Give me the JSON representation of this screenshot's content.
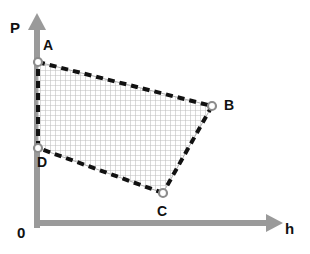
{
  "figure": {
    "width": 310,
    "height": 254,
    "background": "#ffffff"
  },
  "axes": {
    "y_axis": {
      "label": "P",
      "name": "pressure-axis",
      "color": "#9a9a9a",
      "x": 37,
      "y_top": 14,
      "y_bottom": 228,
      "stroke_width": 6,
      "arrow": "up"
    },
    "x_axis": {
      "label": "h",
      "name": "enthalpy-axis",
      "color": "#9a9a9a",
      "y": 223,
      "x_left": 37,
      "x_right": 283,
      "stroke_width": 6,
      "arrow": "right"
    },
    "origin_label": "0"
  },
  "chart_data": {
    "type": "scatter",
    "title": "",
    "xlabel": "h",
    "ylabel": "P",
    "grid": true,
    "legend": "none",
    "shape": "quadrilateral",
    "points": [
      {
        "label": "A",
        "x": 38,
        "y": 62,
        "label_x": 43,
        "label_y": 38
      },
      {
        "label": "B",
        "x": 212,
        "y": 106,
        "label_x": 224,
        "label_y": 98
      },
      {
        "label": "C",
        "x": 163,
        "y": 193,
        "label_x": 157,
        "label_y": 204
      },
      {
        "label": "D",
        "x": 38,
        "y": 148,
        "label_x": 37,
        "label_y": 155
      }
    ],
    "edges": [
      {
        "from": "A",
        "to": "B",
        "style": "dashed"
      },
      {
        "from": "B",
        "to": "C",
        "style": "dashed"
      },
      {
        "from": "C",
        "to": "D",
        "style": "dashed"
      },
      {
        "from": "D",
        "to": "A",
        "style": "dashed"
      }
    ],
    "fill": {
      "pattern": "crosshatch-grid",
      "spacing": 5,
      "line_color": "#bdbdbd",
      "background": "#ffffff"
    }
  },
  "style": {
    "edge_color": "#111111",
    "edge_width": 4,
    "dash_pattern": "7 5",
    "vertex_fill": "#ffffff",
    "vertex_stroke": "#8c8c8c",
    "vertex_radius": 4,
    "outline_color": "#b0b0b0",
    "label_color": "#111111"
  }
}
